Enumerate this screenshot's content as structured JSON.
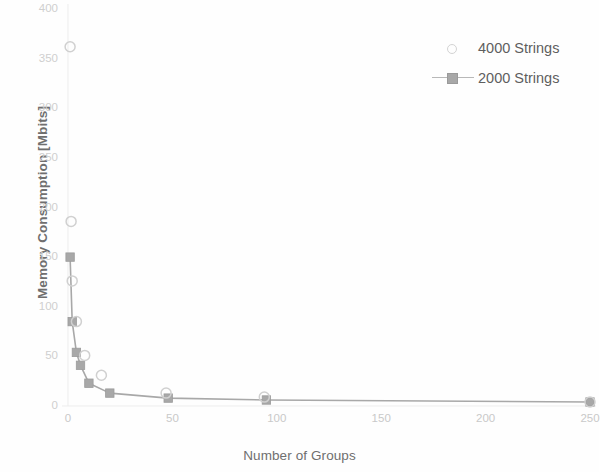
{
  "chart_data": {
    "type": "scatter",
    "title": "",
    "xlabel": "Number of Groups",
    "ylabel": "Memory Consumption [Mbits]",
    "xlim": [
      0,
      250
    ],
    "ylim": [
      0,
      400
    ],
    "xticks": [
      "0",
      "50",
      "100",
      "150",
      "200",
      "250"
    ],
    "yticks": [
      "0",
      "50",
      "100",
      "150",
      "200",
      "250",
      "300",
      "350",
      "400"
    ],
    "grid": false,
    "legend_position": "top-right",
    "series": [
      {
        "name": "4000 Strings",
        "marker": "open-circle",
        "line": false,
        "color": "#d0d0d0",
        "x": [
          1,
          1.5,
          2,
          4,
          8,
          16,
          47,
          94,
          250
        ],
        "values": [
          361,
          185,
          125,
          84,
          50,
          30,
          12,
          8,
          3
        ]
      },
      {
        "name": "2000 Strings",
        "marker": "filled-square",
        "line": true,
        "color": "#a8a8a8",
        "x": [
          1,
          2,
          4,
          6,
          10,
          20,
          48,
          95,
          250
        ],
        "values": [
          149,
          84,
          53,
          40,
          22,
          12,
          7,
          5,
          3
        ]
      }
    ]
  },
  "legend": {
    "items": [
      {
        "label": "4000 Strings",
        "key": "open-circle-marker"
      },
      {
        "label": "2000 Strings",
        "key": "line-square-marker"
      }
    ]
  },
  "axes": {
    "x_title": "Number of Groups",
    "y_title": "Memory Consumption [Mbits]"
  },
  "colors": {
    "series_4000": "#d0d0d0",
    "series_2000": "#a8a8a8",
    "axis_text": "#c9c9c9",
    "title_text": "#6f6f6f",
    "background": "#fefefe"
  }
}
